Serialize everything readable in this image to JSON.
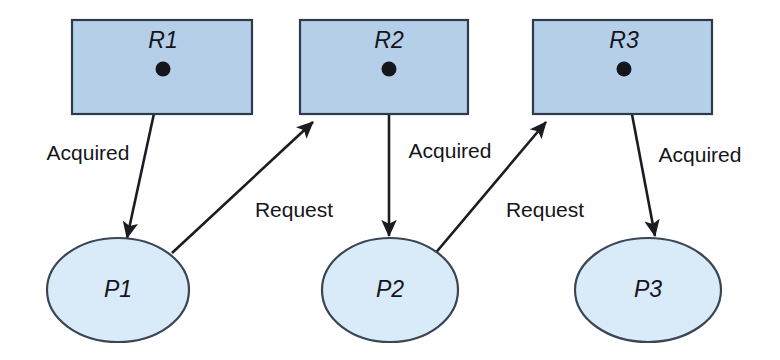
{
  "diagram": {
    "canvas": {
      "width": 780,
      "height": 360
    },
    "colors": {
      "resource_fill": "#b6cfe9",
      "resource_stroke": "#2d3a4a",
      "process_fill": "#d9eaf8",
      "process_stroke": "#3a4653",
      "edge": "#1b1c22",
      "dot": "#15161c",
      "background": "#ffffff"
    },
    "resources": [
      {
        "id": "R1",
        "label": "R1",
        "x": 72,
        "y": 20,
        "w": 180,
        "h": 94,
        "dot_x": 163,
        "dot_y": 69
      },
      {
        "id": "R2",
        "label": "R2",
        "x": 300,
        "y": 20,
        "w": 168,
        "h": 94,
        "dot_x": 389,
        "dot_y": 69
      },
      {
        "id": "R3",
        "label": "R3",
        "x": 533,
        "y": 20,
        "w": 179,
        "h": 94,
        "dot_x": 624,
        "dot_y": 69
      }
    ],
    "processes": [
      {
        "id": "P1",
        "label": "P1",
        "cx": 118,
        "cy": 290,
        "rx": 71,
        "ry": 52
      },
      {
        "id": "P2",
        "label": "P2",
        "cx": 390,
        "cy": 290,
        "rx": 68,
        "ry": 52
      },
      {
        "id": "P3",
        "label": "P3",
        "cx": 648,
        "cy": 290,
        "rx": 73,
        "ry": 52
      }
    ],
    "edges": [
      {
        "id": "e-r1-p1",
        "type": "assignment",
        "label": "Acquired",
        "from": "R1",
        "to": "P1",
        "x1": 163,
        "y1": 72,
        "x2": 127,
        "y2": 238,
        "label_x": 88,
        "label_y": 154
      },
      {
        "id": "e-p1-r2",
        "type": "request",
        "label": "Request",
        "from": "P1",
        "to": "R2",
        "x1": 172,
        "y1": 253,
        "x2": 313,
        "y2": 122,
        "label_x": 294,
        "label_y": 211
      },
      {
        "id": "e-r2-p2",
        "type": "assignment",
        "label": "Acquired",
        "from": "R2",
        "to": "P2",
        "x1": 389,
        "y1": 72,
        "x2": 389,
        "y2": 236,
        "label_x": 450,
        "label_y": 152
      },
      {
        "id": "e-p2-r3",
        "type": "request",
        "label": "Request",
        "from": "P2",
        "to": "R3",
        "x1": 433,
        "y1": 256,
        "x2": 546,
        "y2": 122,
        "label_x": 545,
        "label_y": 211
      },
      {
        "id": "e-r3-p3",
        "type": "assignment",
        "label": "Acquired",
        "from": "R3",
        "to": "P3",
        "x1": 624,
        "y1": 72,
        "x2": 655,
        "y2": 236,
        "label_x": 700,
        "label_y": 156
      }
    ]
  }
}
